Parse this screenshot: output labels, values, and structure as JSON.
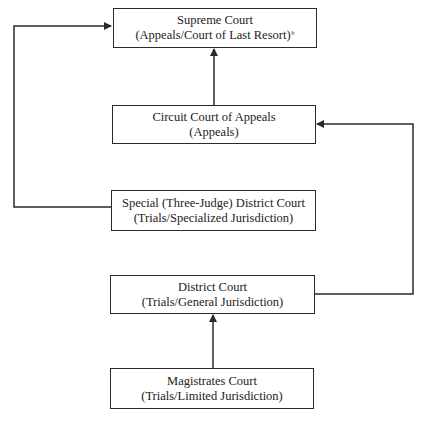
{
  "diagram": {
    "nodes": [
      {
        "id": "supreme",
        "title": "Supreme Court",
        "subtitle": "(Appeals/Court of Last Resort)",
        "footnote": "b"
      },
      {
        "id": "circuit",
        "title": "Circuit Court of Appeals",
        "subtitle": "(Appeals)"
      },
      {
        "id": "special",
        "title": "Special (Three-Judge) District Court",
        "subtitle": "(Trials/Specialized Jurisdiction)"
      },
      {
        "id": "district",
        "title": "District Court",
        "subtitle": "(Trials/General Jurisdiction)"
      },
      {
        "id": "magistrates",
        "title": "Magistrates Court",
        "subtitle": "(Trials/Limited Jurisdiction)"
      }
    ],
    "edges": [
      {
        "from": "magistrates",
        "to": "district",
        "route": "straight up"
      },
      {
        "from": "district",
        "to": "circuit",
        "route": "right loop"
      },
      {
        "from": "circuit",
        "to": "supreme",
        "route": "straight up"
      },
      {
        "from": "special",
        "to": "supreme",
        "route": "left loop"
      }
    ],
    "colors": {
      "line": "#2a2a2a",
      "background": "#ffffff"
    }
  }
}
